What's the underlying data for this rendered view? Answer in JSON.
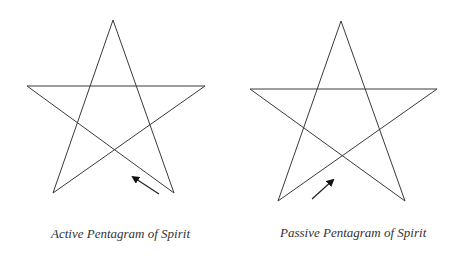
{
  "figures": [
    {
      "caption": "Active Pentagram of Spirit",
      "points": {
        "top": [
          113,
          20
        ],
        "left": [
          27,
          86
        ],
        "right": [
          205,
          86
        ],
        "bottom_left": [
          53,
          193
        ],
        "bottom_right": [
          174,
          193
        ]
      },
      "arrow": {
        "from": [
          159,
          194
        ],
        "to": [
          131,
          176
        ],
        "direction": "up-left"
      }
    },
    {
      "caption": "Passive Pentagram of Spirit",
      "points": {
        "top": [
          341,
          21
        ],
        "left": [
          250,
          89
        ],
        "right": [
          437,
          89
        ],
        "bottom_left": [
          278,
          201
        ],
        "bottom_right": [
          405,
          201
        ]
      },
      "arrow": {
        "from": [
          312,
          199
        ],
        "to": [
          335,
          178
        ],
        "direction": "up-right"
      }
    }
  ],
  "colors": {
    "line": "#3a3a3a",
    "arrow": "#111111",
    "caption": "#333333"
  }
}
